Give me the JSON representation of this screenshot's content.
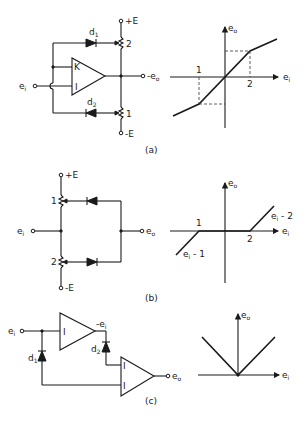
{
  "figure": {
    "panels": [
      {
        "id": "a",
        "caption": "(a)",
        "circuit": {
          "input_label": "e",
          "input_sub": "i",
          "output_label": "-e",
          "output_sub": "o",
          "supply_pos": "+E",
          "supply_neg": "-E",
          "diode_top": "d",
          "diode_top_sub": "1",
          "diode_bottom": "d",
          "diode_bottom_sub": "2",
          "pot_top": "2",
          "pot_bottom": "1",
          "amp_input_top": "K",
          "amp_input_bottom": "I"
        },
        "graph": {
          "x_axis": "e",
          "x_sub": "i",
          "y_axis": "e",
          "y_sub": "o",
          "break_neg": "1",
          "break_pos": "2"
        }
      },
      {
        "id": "b",
        "caption": "(b)",
        "circuit": {
          "input_label": "e",
          "input_sub": "i",
          "output_label": "e",
          "output_sub": "o",
          "supply_pos": "+E",
          "supply_neg": "-E",
          "pot_top": "1",
          "pot_bottom": "2"
        },
        "graph": {
          "x_axis": "e",
          "x_sub": "i",
          "y_axis": "e",
          "y_sub": "o",
          "break_neg": "1",
          "break_pos": "2",
          "seg_neg_label": "e",
          "seg_neg_sub": "i",
          "seg_neg_suffix": " - 1",
          "seg_pos_label": "e",
          "seg_pos_sub": "i",
          "seg_pos_suffix": " - 2"
        }
      },
      {
        "id": "c",
        "caption": "(c)",
        "circuit": {
          "input_label": "e",
          "input_sub": "i",
          "output_label": "e",
          "output_sub": "o",
          "inverter_out_label": "-e",
          "inverter_out_sub": "i",
          "diode_left": "d",
          "diode_left_sub": "1",
          "diode_right": "d",
          "diode_right_sub": "2",
          "amp1_input": "I",
          "amp2_input_top": "I",
          "amp2_input_bottom": "I"
        },
        "graph": {
          "x_axis": "e",
          "x_sub": "i",
          "y_axis": "e",
          "y_sub": "o"
        }
      }
    ]
  }
}
